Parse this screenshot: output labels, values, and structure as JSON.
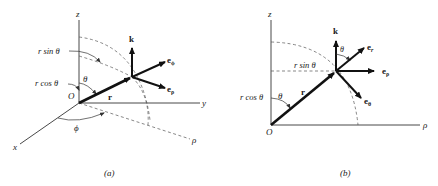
{
  "figure": {
    "panel_a": {
      "caption": "(a)",
      "axes": {
        "z": "z",
        "y": "y",
        "x": "x",
        "rho": "ρ"
      },
      "origin": "O",
      "position_vector": "r",
      "unit_vectors": {
        "k": "k",
        "e_phi": "e",
        "e_phi_sub": "ϕ",
        "e_rho": "e",
        "e_rho_sub": "ρ"
      },
      "labels": {
        "r_sin_theta": "r sin θ",
        "r_cos_theta": "r cos θ",
        "theta": "θ",
        "phi": "ϕ"
      }
    },
    "panel_b": {
      "caption": "(b)",
      "axes": {
        "z": "z",
        "rho": "ρ"
      },
      "origin": "O",
      "position_vector": "r",
      "unit_vectors": {
        "k": "k",
        "e_r": "e",
        "e_r_sub": "r",
        "e_rho": "e",
        "e_rho_sub": "ρ",
        "e_theta": "e",
        "e_theta_sub": "θ"
      },
      "labels": {
        "r_sin_theta": "r sin θ",
        "r_cos_theta": "r cos θ",
        "theta": "θ",
        "theta_top": "θ"
      }
    }
  }
}
